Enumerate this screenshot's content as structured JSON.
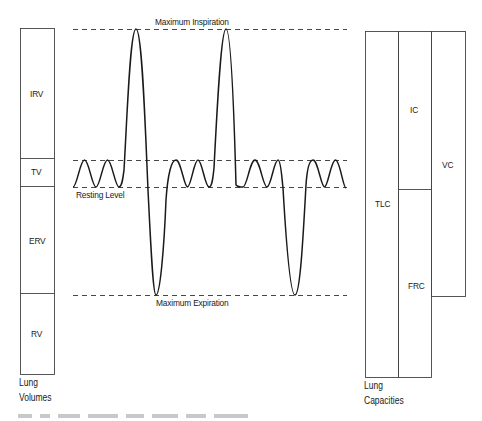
{
  "diagram": {
    "reference_lines": {
      "max_inspiration": "Maximum Inspiration",
      "resting_level": "Resting Level",
      "max_expiration": "Maximum Expiration"
    },
    "lung_volumes": {
      "caption_line1": "Lung",
      "caption_line2": "Volumes",
      "segments": [
        {
          "id": "irv",
          "label": "IRV"
        },
        {
          "id": "tv",
          "label": "TV"
        },
        {
          "id": "erv",
          "label": "ERV"
        },
        {
          "id": "rv",
          "label": "RV"
        }
      ]
    },
    "lung_capacities": {
      "caption_line1": "Lung",
      "caption_line2": "Capacities",
      "segments": [
        {
          "id": "tlc",
          "label": "TLC"
        },
        {
          "id": "ic",
          "label": "IC"
        },
        {
          "id": "frc",
          "label": "FRC"
        },
        {
          "id": "vc",
          "label": "VC"
        }
      ]
    },
    "colors": {
      "line": "#1a1a1a",
      "dashed": "#333333",
      "box": "#444444"
    }
  }
}
